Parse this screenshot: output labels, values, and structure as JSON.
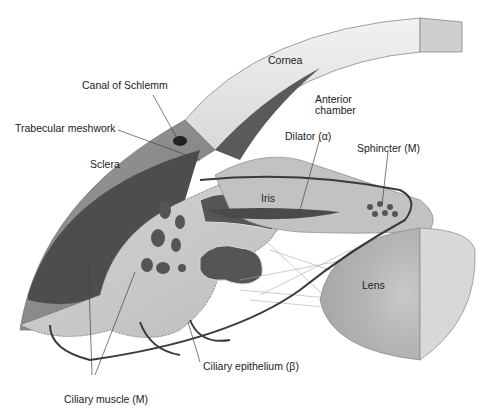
{
  "labels": {
    "cornea": "Cornea",
    "canal": "Canal of Schlemm",
    "trabecular": "Trabecular meshwork",
    "anterior1": "Anterior",
    "anterior2": "chamber",
    "dilator": "Dilator (α)",
    "sphincter": "Sphincter (M)",
    "sclera": "Sclera",
    "iris": "Iris",
    "lens": "Lens",
    "epithelium": "Ciliary epithelium (β)",
    "muscle": "Ciliary muscle (M)"
  },
  "colors": {
    "sclera": "#8e8e8e",
    "muscle": "#4a4a4a",
    "cornea": "#e6e6e6",
    "body": "#c8c8c8",
    "lens": "#b8b8b8",
    "nerve": "#3a3a3a"
  }
}
